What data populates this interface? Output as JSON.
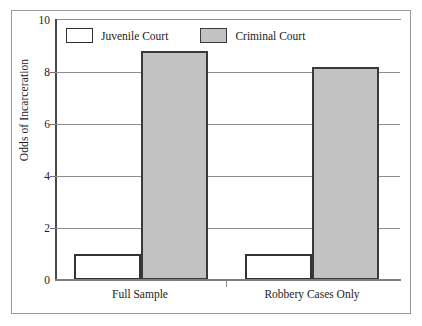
{
  "chart_data": {
    "type": "bar",
    "title": "",
    "xlabel": "",
    "ylabel": "Odds of Incarceration",
    "categories": [
      "Full Sample",
      "Robbery Cases Only"
    ],
    "series": [
      {
        "name": "Juvenile Court",
        "values": [
          1.0,
          1.0
        ],
        "color": "#ffffff"
      },
      {
        "name": "Criminal Court",
        "values": [
          8.8,
          8.2
        ],
        "color": "#c2c2c2"
      }
    ],
    "ylim": [
      0,
      10
    ],
    "yticks": [
      0,
      2,
      4,
      6,
      8,
      10
    ],
    "ytick_labels": [
      "0",
      "2",
      "4",
      "6",
      "8",
      "10"
    ],
    "grid": true,
    "grid_axis": "y",
    "legend_position": "top-left-inside"
  },
  "legend": {
    "entries": [
      {
        "label": "Juvenile Court",
        "swatch": "white"
      },
      {
        "label": "Criminal Court",
        "swatch": "gray"
      }
    ]
  },
  "axes": {
    "y_title": "Odds of Incarceration",
    "y_tick_labels": [
      "10",
      "8",
      "6",
      "4",
      "2",
      "0"
    ],
    "x_tick_labels": [
      "Full Sample",
      "Robbery Cases Only"
    ]
  },
  "colors": {
    "criminal_fill": "#c2c2c2",
    "juvenile_fill": "#ffffff",
    "bar_outline": "#333333",
    "gridline": "#8d8d8d",
    "frame": "#9a9a9a",
    "text": "#232323"
  }
}
